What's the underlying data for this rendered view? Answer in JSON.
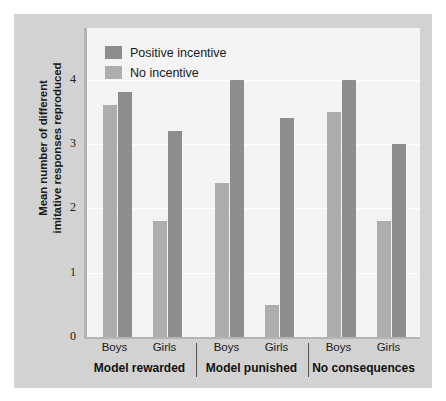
{
  "chart_data": {
    "type": "bar",
    "title": "",
    "subtitle": "",
    "xlabel": "",
    "ylabel_line1": "Mean number of different",
    "ylabel_line2": "imitative responses reproduced",
    "ylim": [
      0,
      4.8
    ],
    "yticks": [
      0,
      1,
      2,
      3,
      4
    ],
    "ytick_labels": [
      "0",
      "1",
      "2",
      "3",
      "4"
    ],
    "grid": "horizontal",
    "legend_position": "top-left",
    "groups": [
      "Model rewarded",
      "Model punished",
      "No consequences"
    ],
    "categories": [
      "Boys",
      "Girls",
      "Boys",
      "Girls",
      "Boys",
      "Girls"
    ],
    "series": [
      {
        "name": "No incentive",
        "color": "#adadad",
        "values": [
          3.6,
          1.8,
          2.4,
          0.5,
          3.5,
          1.8
        ]
      },
      {
        "name": "Positive incentive",
        "color": "#8d8d8d",
        "values": [
          3.8,
          3.2,
          4.0,
          3.4,
          4.0,
          3.0
        ]
      }
    ]
  },
  "legend": {
    "items": [
      {
        "label": "Positive incentive",
        "swatch": "pos-inc"
      },
      {
        "label": "No incentive",
        "swatch": "no-inc"
      }
    ]
  },
  "colors": {
    "page_background": "#ffffff",
    "card_background": "#d2d2d2",
    "plot_background": "#f4f4f4",
    "axis": "#b4b4b4",
    "gridline": "#fefefe",
    "positive_incentive": "#8d8d8d",
    "no_incentive": "#adadad",
    "text": "#1a1a1a"
  }
}
